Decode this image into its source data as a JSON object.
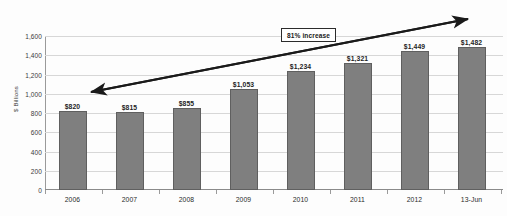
{
  "chart_data": {
    "type": "bar",
    "title": "",
    "subtitle": "",
    "xlabel": "",
    "ylabel": "$ Billions",
    "categories": [
      "2006",
      "2007",
      "2008",
      "2009",
      "2010",
      "2011",
      "2012",
      "13-Jun"
    ],
    "values": [
      820,
      815,
      855,
      1053,
      1234,
      1321,
      1449,
      1482
    ],
    "data_labels": [
      "$820",
      "$815",
      "$855",
      "$1,053",
      "$1,234",
      "$1,321",
      "$1,449",
      "$1,482"
    ],
    "ylim": [
      0,
      1600
    ],
    "ytick_values": [
      0,
      200,
      400,
      600,
      800,
      1000,
      1200,
      1400,
      1600
    ],
    "ytick_labels": [
      "0",
      "200",
      "400",
      "600",
      "800",
      "1,000",
      "1,200",
      "1,400",
      "1,600"
    ],
    "grid": true,
    "legend": false,
    "legend_position": "none",
    "bar_color": "#7f7f7f",
    "bar_border_color": "#5f5f5f",
    "gridline_color": "#d7d7d7",
    "annotations": [
      {
        "name": "percent-increase-callout",
        "text": "81% increase",
        "type": "boxed-label"
      },
      {
        "name": "trend-arrow",
        "type": "double-headed-arrow",
        "from": "2006",
        "to": "13-Jun",
        "color": "#1a1a1a"
      }
    ]
  }
}
